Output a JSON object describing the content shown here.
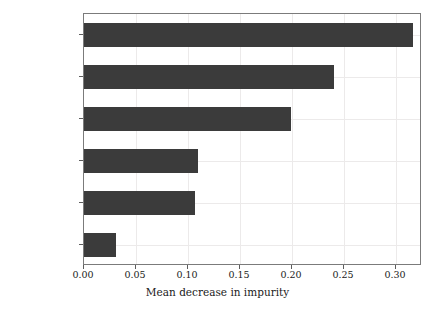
{
  "chart_data": {
    "type": "bar",
    "orientation": "horizontal",
    "title": "",
    "subtitle": "",
    "xlabel": "Mean decrease in impurity",
    "ylabel": "",
    "categories": [
      "capital-gain",
      "education-num",
      "age",
      "hours-per-week",
      "capital-loss",
      "fnlwgt"
    ],
    "values": [
      0.316,
      0.24,
      0.199,
      0.11,
      0.107,
      0.031
    ],
    "xlim": [
      0.0,
      0.325
    ],
    "ylim": [
      -0.5,
      5.5
    ],
    "xticks": [
      0.0,
      0.05,
      0.1,
      0.15,
      0.2,
      0.25,
      0.3
    ],
    "xticklabels": [
      "0.00",
      "0.05",
      "0.10",
      "0.15",
      "0.20",
      "0.25",
      "0.30"
    ],
    "yticklabels": [
      "capital-gain",
      "education-num",
      "age",
      "hours-per-week",
      "capital-loss",
      "fnlwgt"
    ],
    "grid": true,
    "grid_axis": "both",
    "legend": null,
    "legend_position": "none",
    "bar_color": "#3b3b3b",
    "grid_color": "#eceaea",
    "background_color": "#ffffff",
    "axis_color": "#7b7b7b"
  }
}
